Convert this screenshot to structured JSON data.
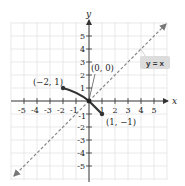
{
  "graph": {
    "axes": {
      "x_label": "x",
      "y_label": "y",
      "x_ticks": [
        "-5",
        "-4",
        "-3",
        "-2",
        "-1",
        "1",
        "2",
        "3",
        "4",
        "5"
      ],
      "y_ticks": [
        "5",
        "4",
        "3",
        "2",
        "1",
        "-1",
        "-2",
        "-3",
        "-4",
        "-5"
      ],
      "range": [
        -6,
        6
      ]
    },
    "points": [
      {
        "label": "(−2, 1)",
        "x": -2,
        "y": 1
      },
      {
        "label": "(0, 0)",
        "x": 0,
        "y": 0
      },
      {
        "label": "(1, −1)",
        "x": 1,
        "y": -1
      }
    ],
    "reference_line": {
      "label": "y = x",
      "style": "dashed",
      "color": "#888888"
    },
    "curve_color": "#333333",
    "label_box_color": "#dcdcdc"
  }
}
